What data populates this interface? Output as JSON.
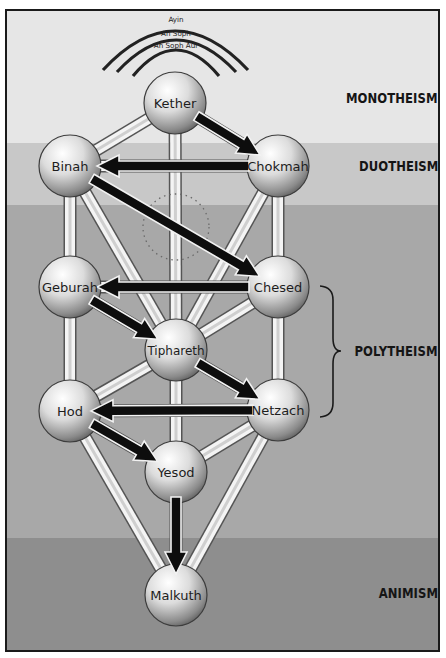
{
  "veils": [
    {
      "label": "Ayin"
    },
    {
      "label": "An Soph"
    },
    {
      "label": "An Soph Aur"
    }
  ],
  "levels": [
    {
      "id": "monotheism",
      "label": "MONOTHEISM",
      "color": "#e6e6e6"
    },
    {
      "id": "duotheism",
      "label": "DUOTHEISM",
      "color": "#c8c8c8"
    },
    {
      "id": "polytheism",
      "label": "POLYTHEISM",
      "color": "#a8a8a8"
    },
    {
      "id": "animism",
      "label": "ANIMISM",
      "color": "#8e8e8e"
    }
  ],
  "nodes": [
    {
      "id": "kether",
      "label": "Kether",
      "x": 175,
      "y": 103
    },
    {
      "id": "binah",
      "label": "Binah",
      "x": 70,
      "y": 166
    },
    {
      "id": "chokmah",
      "label": "Chokmah",
      "x": 278,
      "y": 166
    },
    {
      "id": "geburah",
      "label": "Geburah",
      "x": 70,
      "y": 287
    },
    {
      "id": "chesed",
      "label": "Chesed",
      "x": 278,
      "y": 287
    },
    {
      "id": "tiphareth",
      "label": "Tiphareth",
      "x": 176,
      "y": 350
    },
    {
      "id": "hod",
      "label": "Hod",
      "x": 70,
      "y": 411
    },
    {
      "id": "netzach",
      "label": "Netzach",
      "x": 278,
      "y": 410
    },
    {
      "id": "yesod",
      "label": "Yesod",
      "x": 176,
      "y": 472
    },
    {
      "id": "malkuth",
      "label": "Malkuth",
      "x": 176,
      "y": 595
    }
  ],
  "hidden_node": {
    "id": "daath",
    "x": 176,
    "y": 227,
    "r": 33,
    "style": "dotted"
  },
  "paths": [
    [
      "kether",
      "binah"
    ],
    [
      "kether",
      "tiphareth"
    ],
    [
      "kether",
      "chokmah"
    ],
    [
      "binah",
      "chokmah"
    ],
    [
      "binah",
      "geburah"
    ],
    [
      "binah",
      "tiphareth"
    ],
    [
      "chokmah",
      "chesed"
    ],
    [
      "chokmah",
      "tiphareth"
    ],
    [
      "geburah",
      "chesed"
    ],
    [
      "geburah",
      "tiphareth"
    ],
    [
      "geburah",
      "hod"
    ],
    [
      "chesed",
      "tiphareth"
    ],
    [
      "chesed",
      "netzach"
    ],
    [
      "tiphareth",
      "hod"
    ],
    [
      "tiphareth",
      "netzach"
    ],
    [
      "tiphareth",
      "yesod"
    ],
    [
      "hod",
      "netzach"
    ],
    [
      "hod",
      "yesod"
    ],
    [
      "hod",
      "malkuth"
    ],
    [
      "netzach",
      "yesod"
    ],
    [
      "netzach",
      "malkuth"
    ],
    [
      "yesod",
      "malkuth"
    ]
  ],
  "flow_arrows": [
    {
      "from": "kether",
      "to": "chokmah"
    },
    {
      "from": "chokmah",
      "to": "binah"
    },
    {
      "from": "binah",
      "to": "chesed"
    },
    {
      "from": "chesed",
      "to": "geburah"
    },
    {
      "from": "geburah",
      "to": "tiphareth"
    },
    {
      "from": "tiphareth",
      "to": "netzach"
    },
    {
      "from": "netzach",
      "to": "hod"
    },
    {
      "from": "hod",
      "to": "yesod"
    },
    {
      "from": "yesod",
      "to": "malkuth"
    }
  ],
  "polytheism_brace": {
    "x": 320,
    "y_top": 285,
    "y_bottom": 417
  }
}
